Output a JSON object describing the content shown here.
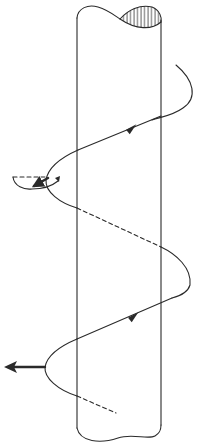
{
  "figure": {
    "caption": "",
    "colors": {
      "ink": "#2a2a2a",
      "background": "#ffffff"
    },
    "elements": {
      "cylinder": "cylinder-body",
      "cap": "hatched-cross-section",
      "helix": "helical-path",
      "front_arrows": [
        "direction-arrow-upper",
        "direction-arrow-lower"
      ],
      "force_arrows": [
        "rotation-arrow-upper",
        "radial-arrow-lower"
      ]
    }
  }
}
